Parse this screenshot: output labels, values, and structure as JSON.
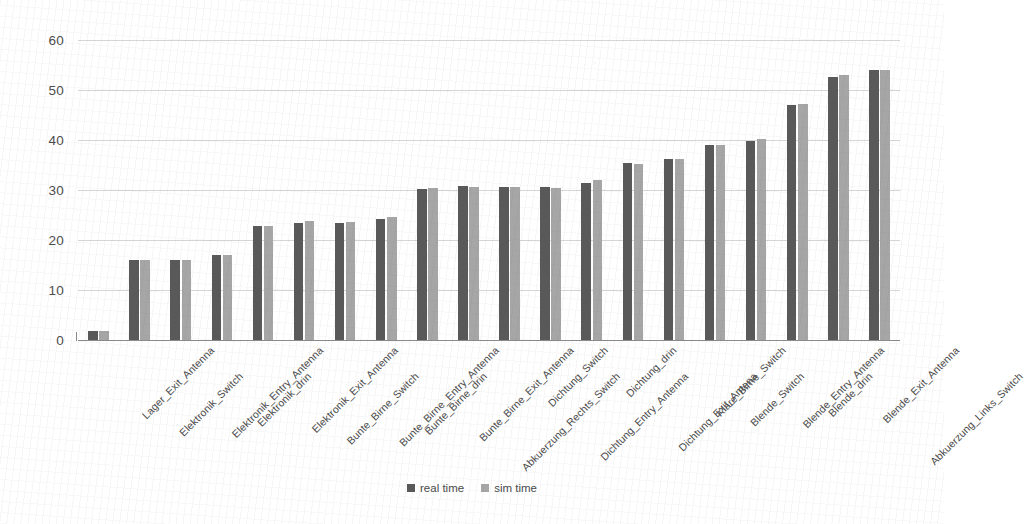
{
  "chart_data": {
    "type": "bar",
    "title": "",
    "xlabel": "",
    "ylabel": "",
    "ylim": [
      0,
      60
    ],
    "yticks": [
      0,
      10,
      20,
      30,
      40,
      50,
      60
    ],
    "grid": true,
    "legend_position": "bottom",
    "categories": [
      "Lager_Exit_Antenna",
      "Elektronik_Switch",
      "Elektronik_Entry_Antenna",
      "Elektronik_drin",
      "Elektronik_Exit_Antenna",
      "Bunte_Birne_Switch",
      "Bunte_Birne_Entry_Antenna",
      "Bunte_Birne_drin",
      "Bunte_Birne_Exit_Antenna",
      "Abkuerzung_Rechts_Switch",
      "Dichtung_Switch",
      "Dichtung_Entry_Antenna",
      "Dichtung_drin",
      "Dichtung_Exit_Antena",
      "Klare_Birne_Switch",
      "Blende_Switch",
      "Blende_Entry_Antenna",
      "Blende_drin",
      "Blende_Exit_Antenna",
      "Abkuerzung_Links_Switch"
    ],
    "series": [
      {
        "name": "real time",
        "color": "#595959",
        "values": [
          1.8,
          16.1,
          16.1,
          17.0,
          22.9,
          23.4,
          23.4,
          24.3,
          30.3,
          30.8,
          30.7,
          30.6,
          31.5,
          35.5,
          36.2,
          39.1,
          39.8,
          47.0,
          52.6,
          54.1
        ]
      },
      {
        "name": "sim time",
        "color": "#a6a6a6",
        "values": [
          1.8,
          16.1,
          16.1,
          17.0,
          22.9,
          23.8,
          23.7,
          24.6,
          30.4,
          30.6,
          30.6,
          30.4,
          32.0,
          35.3,
          36.2,
          39.1,
          40.2,
          47.3,
          53.1,
          54.1
        ]
      }
    ]
  },
  "legend": {
    "items": [
      {
        "label": "real time",
        "color": "#595959"
      },
      {
        "label": "sim time",
        "color": "#a6a6a6"
      }
    ]
  }
}
